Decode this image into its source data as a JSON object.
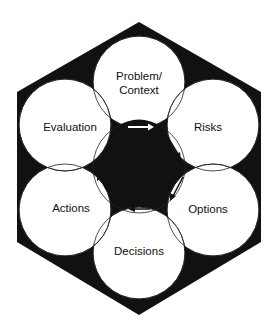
{
  "diagram": {
    "center": {
      "line1": "Engage",
      "line2": "Stakeholders"
    },
    "nodes": [
      {
        "id": "problem",
        "line1": "Problem/",
        "line2": "Context"
      },
      {
        "id": "risks",
        "line1": "Risks"
      },
      {
        "id": "options",
        "line1": "Options"
      },
      {
        "id": "decisions",
        "line1": "Decisions"
      },
      {
        "id": "actions",
        "line1": "Actions"
      },
      {
        "id": "evaluation",
        "line1": "Evaluation"
      }
    ],
    "colors": {
      "hexagon": "#111111",
      "circle": "#ffffff",
      "stroke": "#222222"
    }
  }
}
